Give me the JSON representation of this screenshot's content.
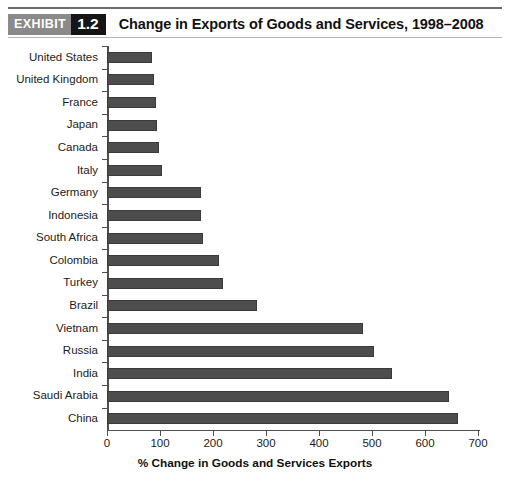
{
  "header": {
    "rule_color": "#6d6d6d",
    "badge_word": "EXHIBIT",
    "badge_number": "1.2",
    "badge_word_bg": "#8a8a8a",
    "badge_number_bg": "#151515",
    "title": "Change in Exports of Goods and Services, 1998–2008"
  },
  "chart_data": {
    "type": "bar",
    "orientation": "horizontal",
    "title": "Change in Exports of Goods and Services, 1998–2008",
    "xlabel": "% Change in Goods and Services Exports",
    "ylabel": "",
    "xlim": [
      0,
      700
    ],
    "xticks": [
      0,
      100,
      200,
      300,
      400,
      500,
      600,
      700
    ],
    "xtick_labels": [
      "0",
      "100",
      "200",
      "300",
      "400",
      "500",
      "600",
      "700"
    ],
    "grid": false,
    "legend": null,
    "bar_color": "#4d4d4d",
    "categories": [
      "United States",
      "United Kingdom",
      "France",
      "Japan",
      "Canada",
      "Italy",
      "Germany",
      "Indonesia",
      "South Africa",
      "Colombia",
      "Turkey",
      "Brazil",
      "Vietnam",
      "Russia",
      "India",
      "Saudi Arabia",
      "China"
    ],
    "values": [
      85,
      88,
      92,
      95,
      98,
      103,
      177,
      178,
      182,
      211,
      218,
      283,
      483,
      503,
      538,
      645,
      662
    ]
  }
}
